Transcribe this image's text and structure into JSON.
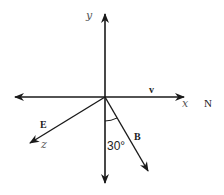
{
  "diagram": {
    "type": "vector-axes",
    "colors": {
      "line": "#1a1a1a",
      "label": "#222222",
      "axis_label": "#555555",
      "background": "#ffffff"
    },
    "origin": {
      "x": 105,
      "y": 97
    },
    "axes": {
      "y": {
        "label": "y"
      },
      "x": {
        "label": "x",
        "direction_label": "N"
      },
      "z": {
        "label": "z"
      }
    },
    "vectors": {
      "v": {
        "label": "v",
        "along": "x"
      },
      "E": {
        "label": "E",
        "along": "z"
      },
      "B": {
        "label": "B",
        "angle_from_negative_y_deg": 30
      }
    },
    "angle_label": "30°"
  }
}
